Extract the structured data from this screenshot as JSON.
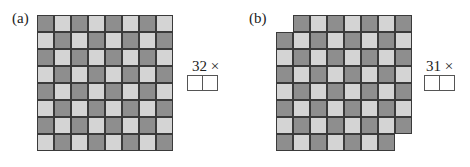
{
  "panels": [
    {
      "label": "(a)",
      "multiplier_text": "32 ×",
      "answer_boxes": 2,
      "grid": {
        "rows": 8,
        "cols": 8,
        "cell_size": 17,
        "origin": [
          37,
          15
        ],
        "first_cell_dark": true,
        "rows_spec": [
          {
            "start": 0,
            "count": 8
          },
          {
            "start": 0,
            "count": 8
          },
          {
            "start": 0,
            "count": 8
          },
          {
            "start": 0,
            "count": 8
          },
          {
            "start": 0,
            "count": 8
          },
          {
            "start": 0,
            "count": 8
          },
          {
            "start": 0,
            "count": 8
          },
          {
            "start": 0,
            "count": 8
          }
        ]
      },
      "label_pos": [
        12,
        11
      ],
      "mult_pos": [
        192,
        59
      ],
      "boxes_pos": [
        187,
        75
      ]
    },
    {
      "label": "(b)",
      "multiplier_text": "31 ×",
      "answer_boxes": 2,
      "grid": {
        "rows": 8,
        "cols": 8,
        "cell_size": 17,
        "origin": [
          276,
          15
        ],
        "first_cell_dark": false,
        "rows_spec": [
          {
            "start": 1,
            "count": 7
          },
          {
            "start": 0,
            "count": 8
          },
          {
            "start": 0,
            "count": 8
          },
          {
            "start": 0,
            "count": 8
          },
          {
            "start": 0,
            "count": 8
          },
          {
            "start": 0,
            "count": 8
          },
          {
            "start": 0,
            "count": 8
          },
          {
            "start": 0,
            "count": 7
          }
        ]
      },
      "label_pos": [
        249,
        11
      ],
      "mult_pos": [
        426,
        59
      ],
      "boxes_pos": [
        424,
        75
      ]
    }
  ],
  "colors": {
    "dark_cell": "#8e8e8e",
    "light_cell": "#d4d4d4",
    "grid_line": "#3a3a3a"
  }
}
